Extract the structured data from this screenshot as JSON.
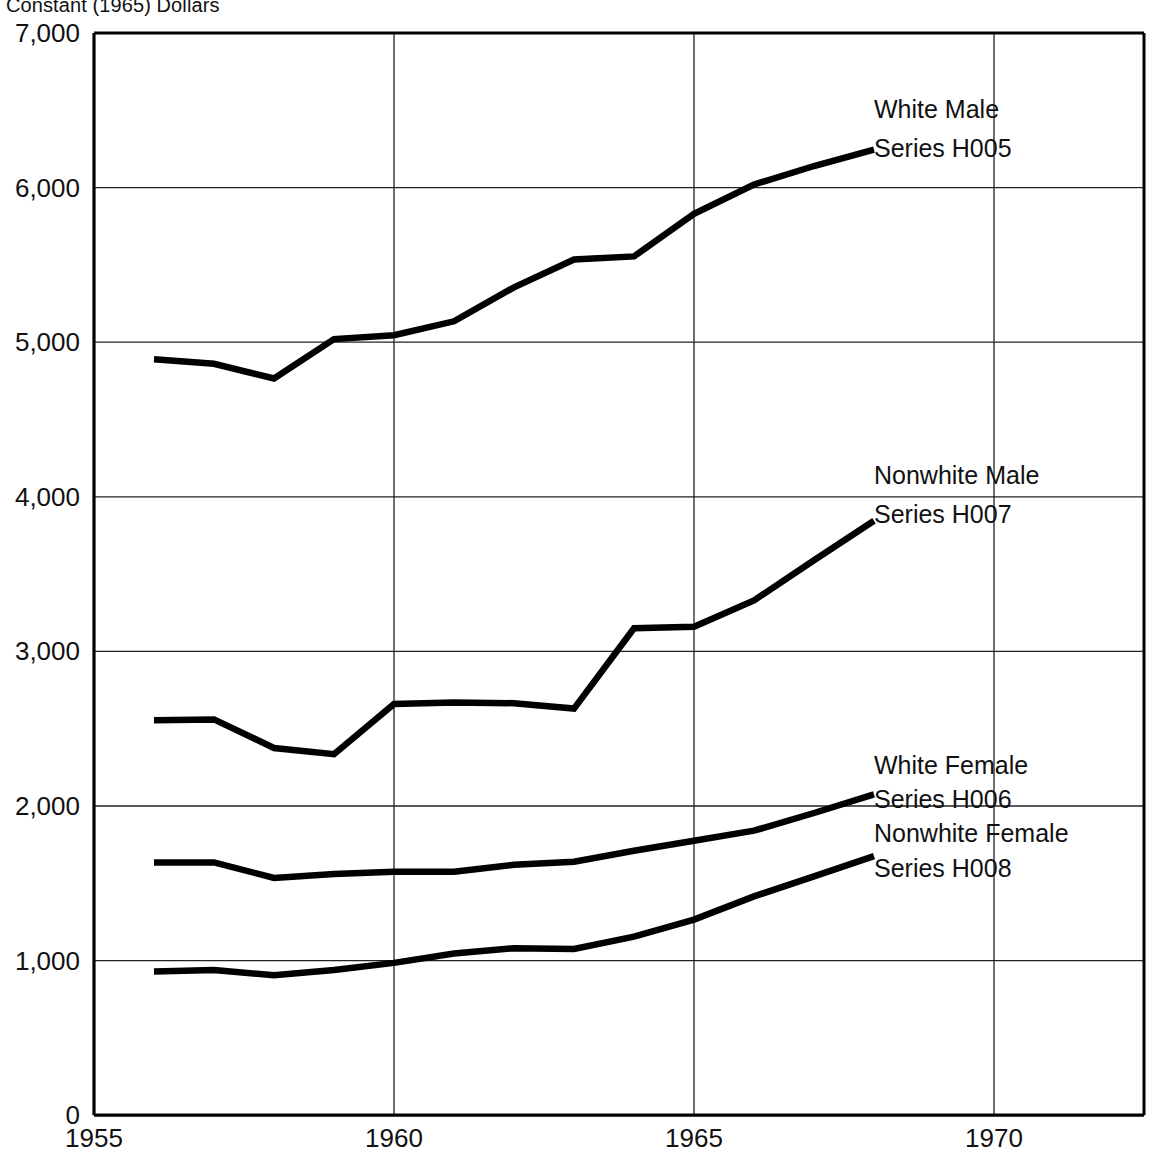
{
  "caption": "Constant (1965) Dollars",
  "chart_data": {
    "type": "line",
    "title": "Constant (1965) Dollars",
    "xlabel": "",
    "ylabel": "",
    "grid": true,
    "legend_position": "inline-right",
    "xlim": [
      1955,
      1971.5
    ],
    "ylim": [
      0,
      7000
    ],
    "xticks": [
      1955,
      1960,
      1965,
      1970
    ],
    "xtick_labels": [
      "1955",
      "1960",
      "1965",
      "1970"
    ],
    "yticks": [
      0,
      1000,
      2000,
      3000,
      4000,
      5000,
      6000,
      7000
    ],
    "ytick_labels": [
      "0",
      "1,000",
      "2,000",
      "3,000",
      "4,000",
      "5,000",
      "6,000",
      "7,000"
    ],
    "x": [
      1956,
      1957,
      1958,
      1959,
      1960,
      1961,
      1962,
      1963,
      1964,
      1965,
      1966,
      1967,
      1968
    ],
    "series": [
      {
        "name": "White Male",
        "code": "Series H005",
        "label_line1": "White Male",
        "label_line2": "Series H005",
        "values": [
          4890,
          4860,
          4765,
          5020,
          5045,
          5135,
          5355,
          5535,
          5555,
          5830,
          6020,
          6140,
          6245
        ]
      },
      {
        "name": "Nonwhite Male",
        "code": "Series H007",
        "label_line1": "Nonwhite Male",
        "label_line2": "Series H007",
        "values": [
          2555,
          2560,
          2375,
          2335,
          2660,
          2670,
          2665,
          2630,
          3150,
          3160,
          3330,
          3590,
          3845
        ]
      },
      {
        "name": "White Female",
        "code": "Series H006",
        "label_line1": "White Female",
        "label_line2": "Series H006",
        "values": [
          1635,
          1635,
          1535,
          1560,
          1575,
          1575,
          1620,
          1640,
          1710,
          1775,
          1840,
          1955,
          2075
        ]
      },
      {
        "name": "Nonwhite Female",
        "code": "Series H008",
        "label_line1": "Nonwhite Female",
        "label_line2": "Series H008",
        "values": [
          930,
          940,
          905,
          940,
          985,
          1045,
          1080,
          1075,
          1155,
          1265,
          1415,
          1545,
          1675
        ]
      }
    ],
    "annotations": [
      {
        "text": "White Male",
        "x": 1968.0,
        "y": 6450
      },
      {
        "text": "Series H005",
        "x": 1968.0,
        "y": 6200
      },
      {
        "text": "Nonwhite Male",
        "x": 1968.0,
        "y": 4080
      },
      {
        "text": "Series H007",
        "x": 1968.0,
        "y": 3830
      },
      {
        "text": "White Female",
        "x": 1968.0,
        "y": 2210
      },
      {
        "text": "Series H006",
        "x": 1968.0,
        "y": 1985
      },
      {
        "text": "Nonwhite Female",
        "x": 1968.0,
        "y": 1770
      },
      {
        "text": "Series H008",
        "x": 1968.0,
        "y": 1540
      }
    ],
    "colors": {
      "line": "#000000",
      "grid": "#222222",
      "axis": "#000000",
      "text": "#111111",
      "background": "#ffffff"
    }
  }
}
